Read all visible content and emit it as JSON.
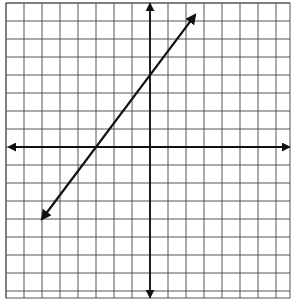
{
  "chart_data": {
    "type": "line",
    "title": "",
    "xlabel": "",
    "ylabel": "",
    "grid": true,
    "xlim": [
      -8,
      8
    ],
    "ylim": [
      -8,
      8
    ],
    "grid_step": 1,
    "axes": {
      "x_arrows": true,
      "y_arrows": true
    },
    "series": [
      {
        "name": "line",
        "equation": "y = (4/3)x + 4",
        "slope": 1.3333,
        "y_intercept": 4,
        "x_intercept": -3,
        "arrows_both_ends": true,
        "points": [
          [
            -6,
            -4
          ],
          [
            -3,
            0
          ],
          [
            0,
            4
          ],
          [
            2.5,
            7.33
          ]
        ]
      }
    ]
  },
  "style": {
    "grid_color": "#555555",
    "axis_color": "#111111",
    "line_color": "#111111",
    "background": "#ffffff"
  },
  "layout": {
    "origin_px": [
      150,
      147
    ],
    "cell_px": 18,
    "grid_left_px": 6,
    "grid_right_px": 290,
    "grid_top_px": 3,
    "grid_bottom_px": 298
  }
}
